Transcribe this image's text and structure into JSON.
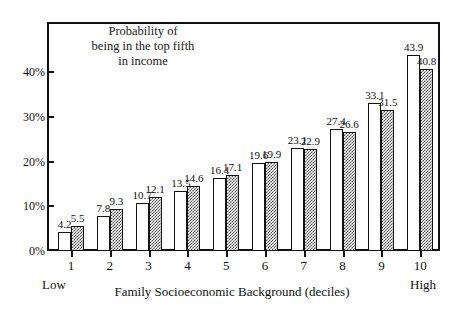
{
  "chart_data": {
    "type": "bar",
    "title": "Probability of being in the top fifth in income",
    "title_lines": [
      "Probability of",
      "being in the top fifth",
      "in income"
    ],
    "xlabel": "Family Socioeconomic Background (deciles)",
    "ylabel": "",
    "categories": [
      "1",
      "2",
      "3",
      "4",
      "5",
      "6",
      "7",
      "8",
      "9",
      "10"
    ],
    "series": [
      {
        "name": "open",
        "values": [
          4.2,
          7.8,
          10.7,
          13.5,
          16.4,
          19.6,
          23.1,
          27.4,
          33.1,
          43.9
        ]
      },
      {
        "name": "shaded",
        "values": [
          5.5,
          9.3,
          12.1,
          14.6,
          17.1,
          19.9,
          22.9,
          26.6,
          31.5,
          40.8
        ]
      }
    ],
    "ylim": [
      0,
      47
    ],
    "yticks": [
      0,
      10,
      20,
      30,
      40
    ],
    "ytick_labels": [
      "0%",
      "10%",
      "20%",
      "30%",
      "40%"
    ],
    "grid": false,
    "legend": "none",
    "axis_endpoint_low": "Low",
    "axis_endpoint_high": "High"
  }
}
